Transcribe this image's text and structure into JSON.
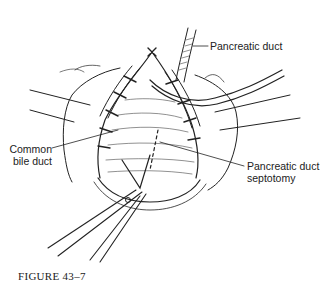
{
  "figure": {
    "caption": "FIGURE 43–7",
    "labels": {
      "pancreatic_duct": "Pancreatic duct",
      "common_bile_duct_line1": "Common",
      "common_bile_duct_line2": "bile duct",
      "septotomy_line1": "Pancreatic duct",
      "septotomy_line2": "septotomy"
    }
  }
}
